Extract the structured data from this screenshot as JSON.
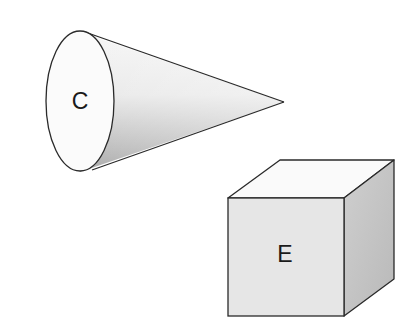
{
  "diagram": {
    "shapes": [
      {
        "id": "cone",
        "type": "cone",
        "label": "C"
      },
      {
        "id": "cube",
        "type": "cube",
        "label": "E"
      }
    ],
    "colors": {
      "outline": "#2a2a2a",
      "background": "#ffffff",
      "cone_base": "#fbfbfb",
      "cone_body_light": "#f4f4f4",
      "cone_body_dark": "#b8b8b8",
      "cube_front": "#e6e6e6",
      "cube_top": "#fafafa",
      "cube_side": "#c4c4c4"
    }
  }
}
